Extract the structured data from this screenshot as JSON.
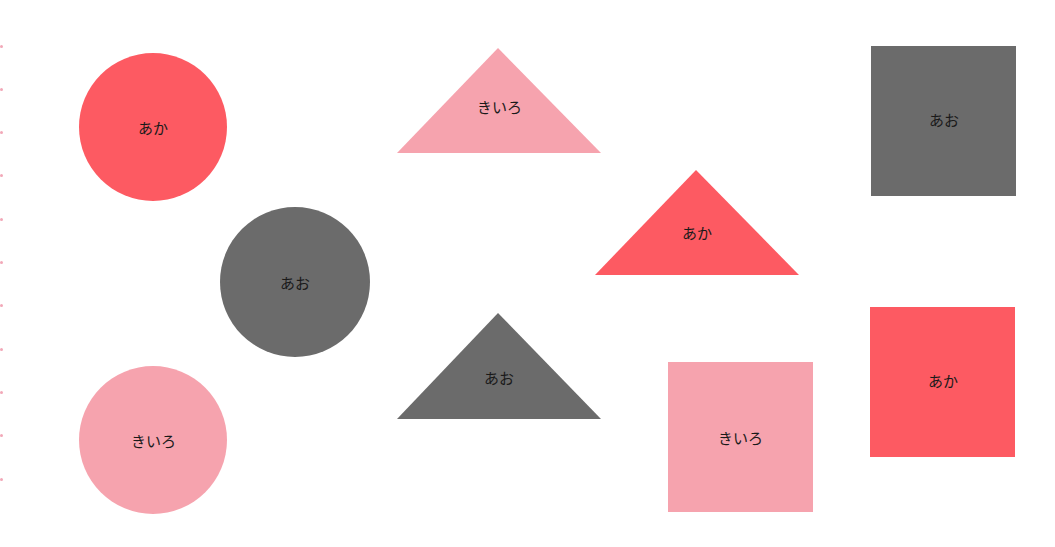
{
  "colors": {
    "aka": "#fd5a62",
    "ao": "#6b6b6b",
    "kiiro": "#f6a3ae",
    "background": "#ffffff",
    "edge_dots": "#f2a8b8"
  },
  "shapes": {
    "circles": [
      {
        "label": "あか",
        "color": "#fd5a62"
      },
      {
        "label": "あお",
        "color": "#6b6b6b"
      },
      {
        "label": "きいろ",
        "color": "#f6a3ae"
      }
    ],
    "triangles": [
      {
        "label": "きいろ",
        "color": "#f6a3ae"
      },
      {
        "label": "あか",
        "color": "#fd5a62"
      },
      {
        "label": "あお",
        "color": "#6b6b6b"
      }
    ],
    "squares": [
      {
        "label": "あお",
        "color": "#6b6b6b"
      },
      {
        "label": "あか",
        "color": "#fd5a62"
      },
      {
        "label": "きいろ",
        "color": "#f6a3ae"
      }
    ]
  }
}
